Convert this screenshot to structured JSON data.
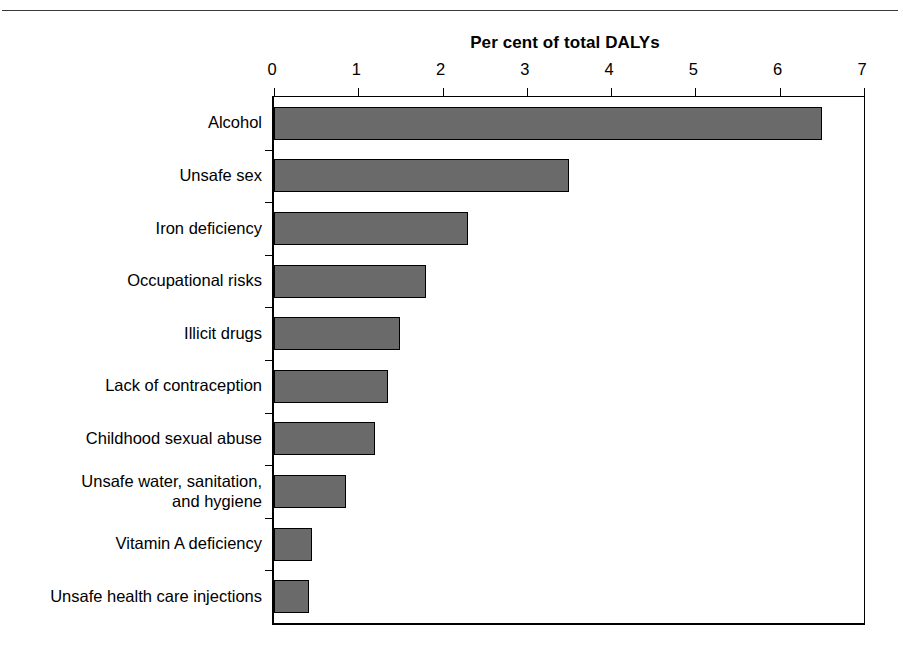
{
  "chart_data": {
    "type": "bar",
    "orientation": "horizontal",
    "title": "Per cent of total DALYs",
    "xlabel": "",
    "ylabel": "",
    "xlim": [
      0,
      7
    ],
    "ylim": null,
    "grid": false,
    "legend": null,
    "x_ticks": [
      "0",
      "1",
      "2",
      "3",
      "4",
      "5",
      "6",
      "7"
    ],
    "x_tick_values": [
      0,
      1,
      2,
      3,
      4,
      5,
      6,
      7
    ],
    "categories": [
      "Alcohol",
      "Unsafe sex",
      "Iron deficiency",
      "Occupational risks",
      "Illicit drugs",
      "Lack of contraception",
      "Childhood sexual abuse",
      "Unsafe water, sanitation,\nand hygiene",
      "Vitamin A deficiency",
      "Unsafe health care injections"
    ],
    "values": [
      6.5,
      3.5,
      2.3,
      1.8,
      1.5,
      1.35,
      1.2,
      0.85,
      0.45,
      0.42
    ],
    "bar_color": "#6a6a6a",
    "bar_edge_color": "#000000",
    "background_color": "#ffffff"
  }
}
